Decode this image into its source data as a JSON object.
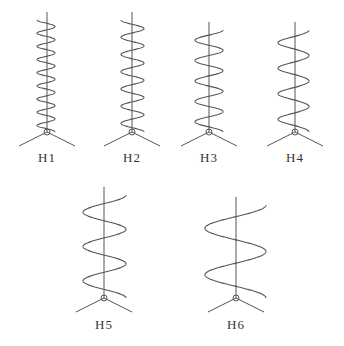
{
  "figure": {
    "antennas": [
      {
        "id": "H1",
        "label": "H1",
        "cx": 47,
        "top": 20,
        "base": 132,
        "turns": 8.5,
        "rl": 10,
        "rr": 8,
        "ly": 150
      },
      {
        "id": "H2",
        "label": "H2",
        "cx": 132,
        "top": 20,
        "base": 132,
        "turns": 6.5,
        "rl": 11,
        "rr": 12,
        "ly": 150
      },
      {
        "id": "H3",
        "label": "H3",
        "cx": 209,
        "top": 30,
        "base": 132,
        "turns": 5,
        "rl": 14,
        "rr": 14,
        "ly": 150
      },
      {
        "id": "H4",
        "label": "H4",
        "cx": 295,
        "top": 30,
        "base": 132,
        "turns": 4,
        "rl": 17,
        "rr": 14,
        "ly": 150
      },
      {
        "id": "H5",
        "label": "H5",
        "cx": 104,
        "top": 195,
        "base": 298,
        "turns": 3,
        "rl": 21,
        "rr": 22,
        "ly": 317
      },
      {
        "id": "H6",
        "label": "H6",
        "cx": 236,
        "top": 205,
        "base": 298,
        "turns": 2,
        "rl": 31,
        "rr": 30,
        "ly": 317
      }
    ],
    "stroke_color": "#555555"
  }
}
